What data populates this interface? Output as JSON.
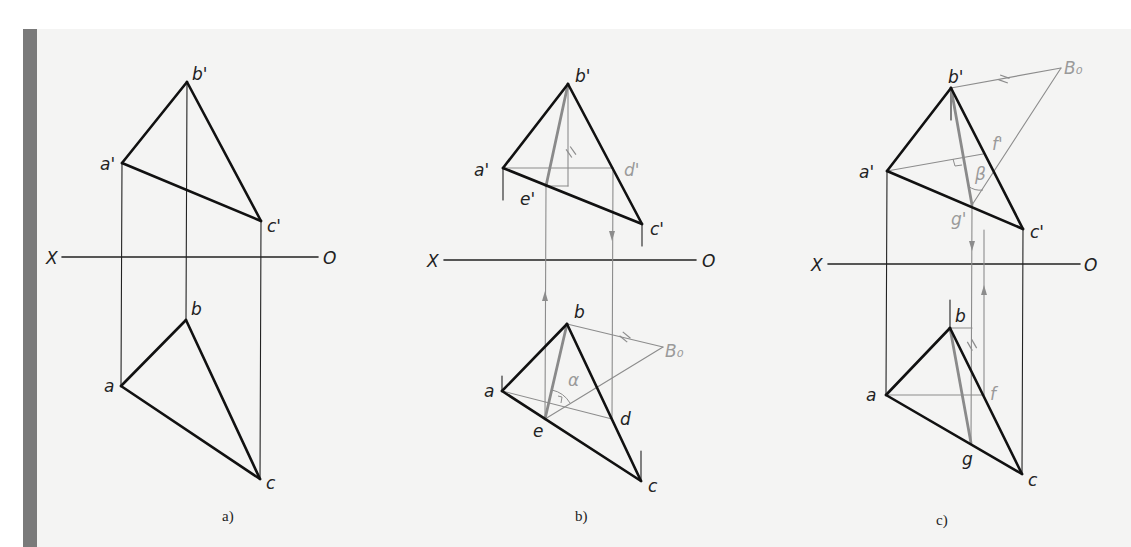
{
  "colors": {
    "thick": "#111111",
    "thin": "#222222",
    "construction": "#8c8c8c",
    "construction_thick": "#8a8a8a",
    "label": "#222222",
    "label_gray": "#9a9a9a",
    "paper": "#f4f4f3",
    "sidebar": "#7a7a7a"
  },
  "panels": [
    {
      "id": "a",
      "caption": "a)",
      "caption_pos": [
        222,
        521
      ],
      "axis": {
        "x1": 62,
        "x2": 318,
        "y": 257,
        "left_label": "X",
        "right_label": "O",
        "left_label_pos": [
          46,
          264
        ],
        "right_label_pos": [
          323,
          264
        ]
      },
      "thick_lines": [
        [
          122,
          163,
          187,
          82
        ],
        [
          187,
          82,
          261,
          221
        ],
        [
          122,
          163,
          261,
          221
        ],
        [
          121,
          386,
          186,
          320
        ],
        [
          186,
          320,
          260,
          479
        ],
        [
          121,
          386,
          260,
          479
        ]
      ],
      "thin_lines": [
        [
          122,
          163,
          121,
          386
        ],
        [
          187,
          82,
          186,
          320
        ],
        [
          261,
          221,
          260,
          479
        ]
      ],
      "gray_lines": [],
      "gray_thick_lines": [],
      "arrows": [],
      "labels": [
        {
          "text": "b'",
          "x": 192,
          "y": 80,
          "gray": false
        },
        {
          "text": "a'",
          "x": 100,
          "y": 170,
          "gray": false
        },
        {
          "text": "c'",
          "x": 267,
          "y": 232,
          "gray": false
        },
        {
          "text": "b",
          "x": 191,
          "y": 315,
          "gray": false
        },
        {
          "text": "a",
          "x": 104,
          "y": 392,
          "gray": false
        },
        {
          "text": "c",
          "x": 266,
          "y": 489,
          "gray": false
        }
      ]
    },
    {
      "id": "b",
      "caption": "b)",
      "caption_pos": [
        575,
        521
      ],
      "axis": {
        "x1": 444,
        "x2": 696,
        "y": 260,
        "left_label": "X",
        "right_label": "O",
        "left_label_pos": [
          427,
          267
        ],
        "right_label_pos": [
          702,
          267
        ]
      },
      "thick_lines": [
        [
          503,
          168,
          568,
          84
        ],
        [
          568,
          84,
          642,
          224
        ],
        [
          503,
          168,
          642,
          224
        ],
        [
          502,
          391,
          567,
          324
        ],
        [
          567,
          324,
          641,
          481
        ],
        [
          502,
          391,
          641,
          481
        ]
      ],
      "thin_lines": [
        [
          503,
          168,
          503,
          200
        ],
        [
          642,
          224,
          642,
          246
        ],
        [
          502,
          391,
          502,
          376
        ],
        [
          641,
          481,
          641,
          451
        ]
      ],
      "gray_lines": [
        [
          503,
          168,
          613,
          168
        ],
        [
          568,
          84,
          568,
          186
        ],
        [
          568,
          186,
          546,
          186
        ],
        [
          546,
          186,
          545,
          419
        ],
        [
          613,
          168,
          612,
          419
        ],
        [
          502,
          391,
          612,
          419
        ],
        [
          567,
          324,
          663,
          347
        ],
        [
          545,
          419,
          663,
          347
        ]
      ],
      "gray_thick_lines": [
        [
          568,
          84,
          546,
          186
        ],
        [
          567,
          324,
          545,
          419
        ]
      ],
      "arrows": [
        {
          "x": 545,
          "y": 298,
          "dir": "up"
        },
        {
          "x": 612,
          "y": 234,
          "dir": "down"
        }
      ],
      "marks": [
        {
          "type": "double-tick",
          "x": 571,
          "y": 152,
          "angle": -35
        },
        {
          "type": "double-tick",
          "x": 625,
          "y": 337,
          "angle": -50
        },
        {
          "type": "right-angle",
          "points": "558,396 562,397 561,403"
        },
        {
          "type": "arc",
          "d": "M 552,390 A 28 28 0 0 1 570,403"
        }
      ],
      "labels": [
        {
          "text": "b'",
          "x": 575,
          "y": 82,
          "gray": false
        },
        {
          "text": "a'",
          "x": 474,
          "y": 176,
          "gray": false
        },
        {
          "text": "d'",
          "x": 624,
          "y": 176,
          "gray": true
        },
        {
          "text": "e'",
          "x": 520,
          "y": 205,
          "gray": false
        },
        {
          "text": "c'",
          "x": 650,
          "y": 235,
          "gray": false
        },
        {
          "text": "b",
          "x": 574,
          "y": 318,
          "gray": false
        },
        {
          "text": "B₀",
          "x": 665,
          "y": 357,
          "gray": true
        },
        {
          "text": "α",
          "x": 568,
          "y": 386,
          "gray": true
        },
        {
          "text": "a",
          "x": 484,
          "y": 397,
          "gray": false
        },
        {
          "text": "e",
          "x": 533,
          "y": 437,
          "gray": false
        },
        {
          "text": "d",
          "x": 620,
          "y": 425,
          "gray": false
        },
        {
          "text": "c",
          "x": 648,
          "y": 492,
          "gray": false
        }
      ]
    },
    {
      "id": "c",
      "caption": "c)",
      "caption_pos": [
        936,
        525
      ],
      "axis": {
        "x1": 828,
        "x2": 1080,
        "y": 264,
        "left_label": "X",
        "right_label": "O",
        "left_label_pos": [
          811,
          271
        ],
        "right_label_pos": [
          1084,
          271
        ]
      },
      "thick_lines": [
        [
          887,
          171,
          951,
          88
        ],
        [
          951,
          88,
          1023,
          229
        ],
        [
          887,
          171,
          1023,
          229
        ],
        [
          886,
          395,
          950,
          328
        ],
        [
          950,
          328,
          1022,
          474
        ],
        [
          886,
          395,
          1022,
          474
        ]
      ],
      "thin_lines": [
        [
          887,
          171,
          886,
          395
        ],
        [
          1023,
          229,
          1022,
          474
        ],
        [
          951,
          88,
          951,
          120
        ],
        [
          950,
          328,
          950,
          300
        ]
      ],
      "gray_lines": [
        [
          951,
          88,
          1061,
          68
        ],
        [
          887,
          171,
          983,
          154
        ],
        [
          972,
          205,
          1061,
          68
        ],
        [
          972,
          205,
          971,
          443
        ],
        [
          984,
          230,
          984,
          395
        ],
        [
          886,
          395,
          984,
          395
        ],
        [
          950,
          328,
          972,
          328
        ]
      ],
      "gray_thick_lines": [
        [
          951,
          88,
          972,
          205
        ],
        [
          950,
          328,
          971,
          443
        ]
      ],
      "arrows": [
        {
          "x": 972,
          "y": 244,
          "dir": "down"
        },
        {
          "x": 984,
          "y": 292,
          "dir": "up"
        }
      ],
      "marks": [
        {
          "type": "double-tick",
          "x": 1004,
          "y": 79,
          "angle": -70
        },
        {
          "type": "double-tick",
          "x": 972,
          "y": 345,
          "angle": -30
        },
        {
          "type": "right-angle",
          "points": "953,159 955,166 962,165"
        },
        {
          "type": "arc",
          "d": "M 968,186 A 20 20 0 0 0 983,190"
        }
      ],
      "labels": [
        {
          "text": "b'",
          "x": 948,
          "y": 83,
          "gray": false
        },
        {
          "text": "B₀",
          "x": 1064,
          "y": 74,
          "gray": true
        },
        {
          "text": "f'",
          "x": 992,
          "y": 150,
          "gray": true
        },
        {
          "text": "a'",
          "x": 859,
          "y": 178,
          "gray": false
        },
        {
          "text": "β",
          "x": 975,
          "y": 180,
          "gray": true
        },
        {
          "text": "g'",
          "x": 951,
          "y": 225,
          "gray": true
        },
        {
          "text": "c'",
          "x": 1030,
          "y": 238,
          "gray": false
        },
        {
          "text": "b",
          "x": 955,
          "y": 322,
          "gray": false
        },
        {
          "text": "a",
          "x": 866,
          "y": 401,
          "gray": false
        },
        {
          "text": "f",
          "x": 990,
          "y": 400,
          "gray": true
        },
        {
          "text": "g",
          "x": 962,
          "y": 465,
          "gray": false
        },
        {
          "text": "c",
          "x": 1028,
          "y": 486,
          "gray": false
        }
      ]
    }
  ]
}
